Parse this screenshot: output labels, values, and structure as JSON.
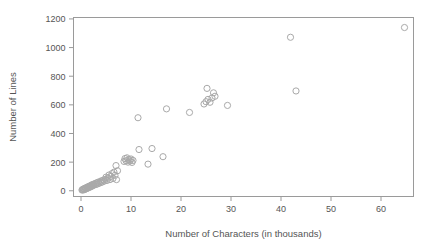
{
  "chart_data": {
    "type": "scatter",
    "title": "",
    "xlabel": "Number of Characters (in thousands)",
    "ylabel": "Number of Lines",
    "xlim": [
      -1.5,
      66.5
    ],
    "ylim": [
      -40,
      1210
    ],
    "xticks": [
      0,
      10,
      20,
      30,
      40,
      50,
      60
    ],
    "xtick_labels": [
      "0",
      "10",
      "20",
      "30",
      "40",
      "50",
      "60"
    ],
    "yticks": [
      0,
      200,
      400,
      600,
      800,
      1000,
      1200
    ],
    "ytick_labels": [
      "0",
      "200",
      "400",
      "600",
      "800",
      "1000",
      "1200"
    ],
    "grid": false,
    "legend": null,
    "marker": {
      "shape": "open-circle",
      "radius": 3.1,
      "stroke_color": "#a9a9a9",
      "fill": "none"
    },
    "axis_color": "#9a9a9a",
    "text_color": "#555555",
    "background": "#ffffff",
    "points": [
      [
        0.2,
        5
      ],
      [
        0.3,
        8
      ],
      [
        0.4,
        10
      ],
      [
        0.5,
        6
      ],
      [
        0.6,
        14
      ],
      [
        0.7,
        9
      ],
      [
        0.8,
        18
      ],
      [
        0.9,
        12
      ],
      [
        1.0,
        20
      ],
      [
        1.1,
        15
      ],
      [
        1.2,
        24
      ],
      [
        1.3,
        18
      ],
      [
        1.4,
        28
      ],
      [
        1.5,
        22
      ],
      [
        1.6,
        30
      ],
      [
        1.7,
        25
      ],
      [
        1.8,
        34
      ],
      [
        1.9,
        27
      ],
      [
        2.0,
        38
      ],
      [
        2.1,
        31
      ],
      [
        2.2,
        42
      ],
      [
        2.4,
        36
      ],
      [
        2.5,
        46
      ],
      [
        2.6,
        40
      ],
      [
        2.8,
        50
      ],
      [
        3.0,
        44
      ],
      [
        3.1,
        55
      ],
      [
        3.3,
        48
      ],
      [
        3.4,
        60
      ],
      [
        3.6,
        52
      ],
      [
        3.8,
        64
      ],
      [
        4.0,
        58
      ],
      [
        4.1,
        70
      ],
      [
        4.3,
        62
      ],
      [
        4.5,
        75
      ],
      [
        4.7,
        68
      ],
      [
        4.9,
        80
      ],
      [
        5.0,
        95
      ],
      [
        5.2,
        72
      ],
      [
        5.4,
        88
      ],
      [
        5.6,
        110
      ],
      [
        5.8,
        78
      ],
      [
        6.0,
        100
      ],
      [
        6.2,
        120
      ],
      [
        6.4,
        86
      ],
      [
        6.6,
        130
      ],
      [
        6.8,
        108
      ],
      [
        7.0,
        176
      ],
      [
        7.1,
        78
      ],
      [
        7.3,
        140
      ],
      [
        8.6,
        205
      ],
      [
        8.8,
        225
      ],
      [
        9.0,
        210
      ],
      [
        9.2,
        230
      ],
      [
        9.4,
        200
      ],
      [
        9.6,
        218
      ],
      [
        9.8,
        208
      ],
      [
        10.0,
        222
      ],
      [
        10.2,
        198
      ],
      [
        10.4,
        212
      ],
      [
        11.4,
        510
      ],
      [
        11.6,
        288
      ],
      [
        13.4,
        186
      ],
      [
        14.2,
        295
      ],
      [
        16.4,
        238
      ],
      [
        17.1,
        572
      ],
      [
        21.7,
        547
      ],
      [
        24.6,
        606
      ],
      [
        25.0,
        622
      ],
      [
        25.2,
        715
      ],
      [
        25.4,
        638
      ],
      [
        25.8,
        618
      ],
      [
        26.2,
        648
      ],
      [
        26.5,
        684
      ],
      [
        26.8,
        660
      ],
      [
        29.3,
        596
      ],
      [
        41.9,
        1072
      ],
      [
        43.0,
        697
      ],
      [
        64.7,
        1140
      ]
    ]
  }
}
